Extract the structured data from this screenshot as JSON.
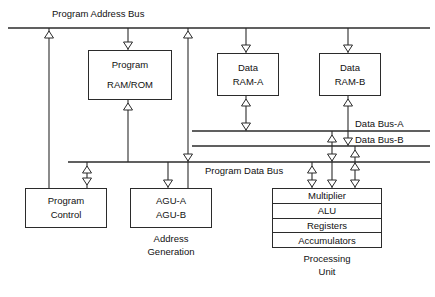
{
  "diagram": {
    "stroke_color": "#2b2b2b",
    "text_color": "#111111",
    "background": "#ffffff"
  },
  "buses": {
    "program_address": {
      "label": "Program Address Bus"
    },
    "data_bus_a": {
      "label": "Data Bus-A"
    },
    "data_bus_b": {
      "label": "Data Bus-B"
    },
    "program_data": {
      "label": "Program Data Bus"
    }
  },
  "blocks": {
    "program_memory": {
      "line1": "Program",
      "line2": "RAM/ROM"
    },
    "data_ram_a": {
      "line1": "Data",
      "line2": "RAM-A"
    },
    "data_ram_b": {
      "line1": "Data",
      "line2": "RAM-B"
    },
    "program_control": {
      "line1": "Program",
      "line2": "Control"
    },
    "agu": {
      "line1": "AGU-A",
      "line2": "AGU-B"
    }
  },
  "processing_unit": {
    "rows": [
      {
        "label": "Multiplier"
      },
      {
        "label": "ALU"
      },
      {
        "label": "Registers"
      },
      {
        "label": "Accumulators"
      }
    ],
    "caption_line1": "Processing",
    "caption_line2": "Unit"
  },
  "captions": {
    "address_generation_line1": "Address",
    "address_generation_line2": "Generation"
  }
}
